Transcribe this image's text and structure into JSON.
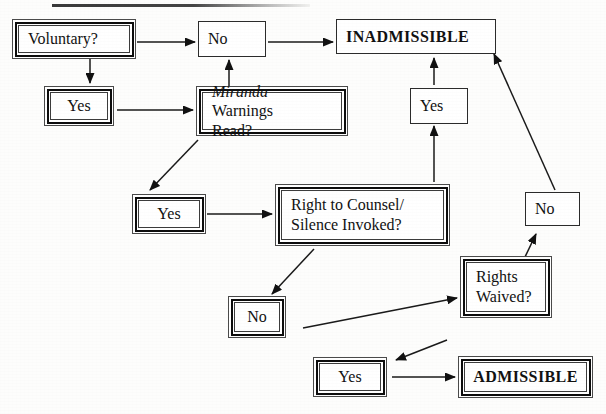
{
  "document": {
    "title": "Confession Admissibility Flowchart",
    "artifact_line": "scan-edge-line"
  },
  "nodes": {
    "voluntary": {
      "label": "Voluntary?",
      "style": "frame"
    },
    "no_top": {
      "label": "No",
      "style": "plain"
    },
    "inadmissible": {
      "label": "INADMISSIBLE",
      "style": "plain"
    },
    "yes_left": {
      "label": "Yes",
      "style": "frame"
    },
    "miranda_line1": "Miranda",
    "miranda_line2": " Warnings",
    "miranda_line3": "Read?",
    "yes_inadmissible": {
      "label": "Yes",
      "style": "plain"
    },
    "yes_counsel": {
      "label": "Yes",
      "style": "frame"
    },
    "right_counsel_line1": "Right to Counsel/",
    "right_counsel_line2": "Silence Invoked?",
    "no_right": {
      "label": "No",
      "style": "plain"
    },
    "no_mid": {
      "label": "No",
      "style": "frame"
    },
    "rights_waived_line1": "Rights",
    "rights_waived_line2": "Waived?",
    "yes_bottom": {
      "label": "Yes",
      "style": "frame"
    },
    "admissible": {
      "label": "ADMISSIBLE",
      "style": "frame"
    }
  },
  "edges": [
    {
      "from": "voluntary",
      "to": "no_top",
      "kind": "horizontal-arrow"
    },
    {
      "from": "no_top",
      "to": "inadmissible",
      "kind": "horizontal-arrow"
    },
    {
      "from": "voluntary",
      "to": "yes_left",
      "kind": "vertical-arrow"
    },
    {
      "from": "yes_left",
      "to": "miranda",
      "kind": "horizontal-arrow"
    },
    {
      "from": "miranda",
      "to": "no_top",
      "kind": "vertical-arrow"
    },
    {
      "from": "miranda",
      "to": "yes_counsel",
      "kind": "diagonal-arrow"
    },
    {
      "from": "yes_counsel",
      "to": "right_counsel",
      "kind": "horizontal-arrow"
    },
    {
      "from": "right_counsel",
      "to": "yes_inadmissible",
      "kind": "vertical-arrow"
    },
    {
      "from": "yes_inadmissible",
      "to": "inadmissible",
      "kind": "vertical-arrow"
    },
    {
      "from": "right_counsel",
      "to": "no_mid",
      "kind": "diagonal-arrow"
    },
    {
      "from": "no_mid",
      "to": "rights_waived",
      "kind": "diagonal-arrow"
    },
    {
      "from": "rights_waived",
      "to": "no_right",
      "kind": "diagonal-arrow"
    },
    {
      "from": "no_right",
      "to": "inadmissible",
      "kind": "diagonal-arrow"
    },
    {
      "from": "rights_waived",
      "to": "yes_bottom",
      "kind": "diagonal-arrow"
    },
    {
      "from": "yes_bottom",
      "to": "admissible",
      "kind": "horizontal-arrow"
    }
  ],
  "colors": {
    "ink": "#111111",
    "paper": "#fdfdfc",
    "rule": "#3a3a3a"
  }
}
